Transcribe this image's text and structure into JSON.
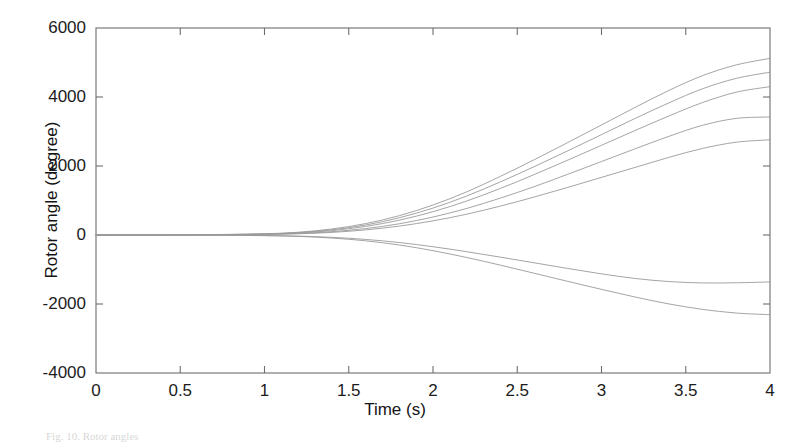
{
  "figure": {
    "background_color": "#ffffff",
    "axis_color": "#6e6e6e",
    "line_color": "#9a9a9a",
    "text_color": "#1c1c1c",
    "caption": "Fig. 10. Rotor angles"
  },
  "chart_data": {
    "type": "line",
    "title": "",
    "subtitle": "",
    "xlabel": "Time (s)",
    "ylabel": "Rotor angle (degree)",
    "xlim": [
      0,
      4
    ],
    "ylim": [
      -4000,
      6000
    ],
    "xticks": [
      0,
      0.5,
      1,
      1.5,
      2,
      2.5,
      3,
      3.5,
      4
    ],
    "xtick_labels": [
      "0",
      "0.5",
      "1",
      "1.5",
      "2",
      "2.5",
      "3",
      "3.5",
      "4"
    ],
    "yticks": [
      -4000,
      -2000,
      0,
      2000,
      4000,
      6000
    ],
    "ytick_labels": [
      "-4000",
      "-2000",
      "0",
      "2000",
      "4000",
      "6000"
    ],
    "grid": false,
    "legend": null,
    "legend_position": "none",
    "annotations": [],
    "x": [
      0,
      0.2,
      0.4,
      0.6,
      0.8,
      1.0,
      1.2,
      1.4,
      1.6,
      1.8,
      2.0,
      2.2,
      2.4,
      2.6,
      2.8,
      3.0,
      3.2,
      3.4,
      3.6,
      3.8,
      4.0
    ],
    "series": [
      {
        "name": "generator-1",
        "values": [
          0,
          2,
          5,
          10,
          18,
          35,
          80,
          175,
          330,
          560,
          870,
          1250,
          1700,
          2180,
          2680,
          3190,
          3700,
          4190,
          4620,
          4930,
          5120
        ]
      },
      {
        "name": "generator-2",
        "values": [
          0,
          2,
          4,
          9,
          16,
          30,
          68,
          150,
          290,
          500,
          780,
          1130,
          1540,
          1980,
          2440,
          2910,
          3380,
          3830,
          4240,
          4540,
          4720
        ]
      },
      {
        "name": "generator-3",
        "values": [
          0,
          1,
          3,
          7,
          13,
          26,
          58,
          128,
          248,
          430,
          676,
          985,
          1350,
          1750,
          2170,
          2600,
          3030,
          3450,
          3840,
          4140,
          4300
        ]
      },
      {
        "name": "generator-4",
        "values": [
          0,
          1,
          2,
          5,
          10,
          20,
          44,
          96,
          186,
          326,
          520,
          770,
          1070,
          1400,
          1760,
          2130,
          2500,
          2860,
          3180,
          3380,
          3420
        ]
      },
      {
        "name": "generator-5",
        "values": [
          0,
          1,
          2,
          4,
          8,
          16,
          35,
          76,
          148,
          258,
          410,
          604,
          838,
          1100,
          1380,
          1670,
          1960,
          2250,
          2510,
          2690,
          2760
        ]
      },
      {
        "name": "generator-6",
        "values": [
          0,
          -1,
          -2,
          -4,
          -8,
          -15,
          -32,
          -68,
          -128,
          -218,
          -340,
          -484,
          -642,
          -806,
          -970,
          -1126,
          -1260,
          -1350,
          -1390,
          -1385,
          -1360
        ]
      },
      {
        "name": "generator-7",
        "values": [
          0,
          -1,
          -2,
          -5,
          -10,
          -19,
          -41,
          -88,
          -168,
          -290,
          -454,
          -652,
          -874,
          -1108,
          -1344,
          -1576,
          -1798,
          -1998,
          -2156,
          -2262,
          -2310
        ]
      }
    ]
  },
  "axes_geometry": {
    "plot_left_px": 96,
    "plot_top_px": 28,
    "plot_right_px": 770,
    "plot_bottom_px": 373
  }
}
